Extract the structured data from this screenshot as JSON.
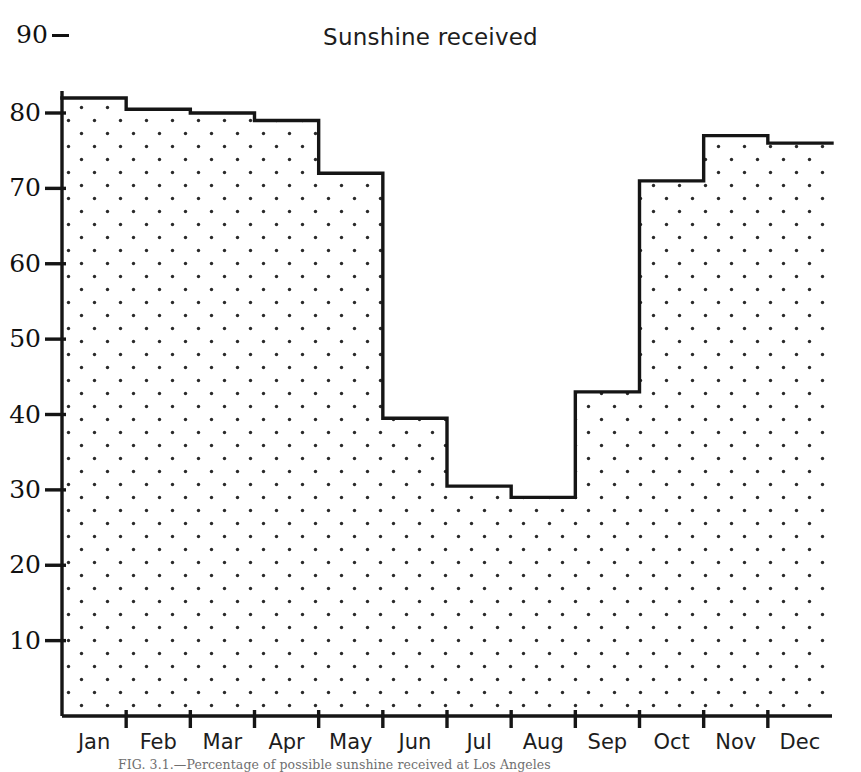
{
  "figure": {
    "title": "Sunshine received",
    "caption": "FIG. 3.1.—Percentage of possible sunshine received at Los Angeles"
  },
  "axes": {
    "y_ticks": [
      "90",
      "80",
      "70",
      "60",
      "50",
      "40",
      "30",
      "20",
      "10"
    ],
    "x_ticks": [
      "Jan",
      "Feb",
      "Mar",
      "Apr",
      "May",
      "Jun",
      "Jul",
      "Aug",
      "Sep",
      "Oct",
      "Nov",
      "Dec"
    ]
  },
  "colors": {
    "line": "#151515",
    "fill": "#ffffff",
    "dot": "#2a2a2a",
    "text": "#111111",
    "background": "#ffffff"
  },
  "chart_data": {
    "type": "bar",
    "subtype": "step-histogram",
    "title": "Sunshine received",
    "xlabel": "",
    "ylabel": "",
    "categories": [
      "Jan",
      "Feb",
      "Mar",
      "Apr",
      "May",
      "Jun",
      "Jul",
      "Aug",
      "Sep",
      "Oct",
      "Nov",
      "Dec"
    ],
    "values": [
      82,
      80.5,
      80,
      79,
      72,
      39.5,
      30.5,
      29,
      43,
      71,
      77,
      76
    ],
    "ylim": [
      0,
      90
    ],
    "yticks": [
      10,
      20,
      30,
      40,
      50,
      60,
      70,
      80,
      90
    ],
    "grid": false,
    "legend": false,
    "fill_pattern": "dotted-stipple"
  }
}
